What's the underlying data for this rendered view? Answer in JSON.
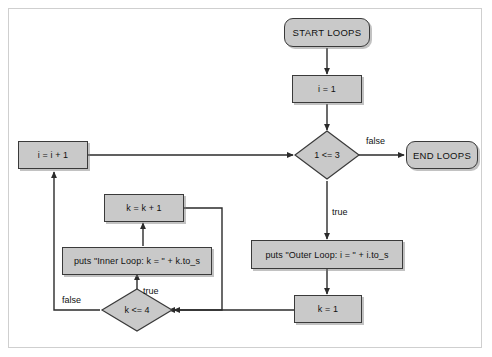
{
  "diagram": {
    "style": {
      "node_fill": "#c9c9c9",
      "node_stroke": "#3a3a3a",
      "line_color": "#2b2b2b",
      "frame_color": "#cfcfcf",
      "background": "#ffffff"
    },
    "nodes": [
      {
        "id": "start",
        "type": "terminator",
        "label": "START LOOPS"
      },
      {
        "id": "i_init",
        "type": "process",
        "label": "i = 1"
      },
      {
        "id": "i_cond",
        "type": "decision",
        "label": "1 <= 3"
      },
      {
        "id": "end",
        "type": "terminator",
        "label": "END LOOPS"
      },
      {
        "id": "i_incr",
        "type": "process",
        "label": "i = i + 1"
      },
      {
        "id": "outer_puts",
        "type": "process",
        "label": "puts \"Outer Loop: i = \" + i.to_s"
      },
      {
        "id": "k_init",
        "type": "process",
        "label": "k = 1"
      },
      {
        "id": "k_cond",
        "type": "decision",
        "label": "k <= 4"
      },
      {
        "id": "inner_puts",
        "type": "process",
        "label": "puts \"Inner Loop: k = \" + k.to_s"
      },
      {
        "id": "k_incr",
        "type": "process",
        "label": "k = k + 1"
      }
    ],
    "edge_labels": {
      "i_cond_false": "false",
      "i_cond_true": "true",
      "k_cond_false": "false",
      "k_cond_true": "true"
    },
    "edges": [
      {
        "from": "start",
        "to": "i_init",
        "label": ""
      },
      {
        "from": "i_init",
        "to": "i_cond",
        "label": ""
      },
      {
        "from": "i_cond",
        "to": "end",
        "label": "false"
      },
      {
        "from": "i_cond",
        "to": "outer_puts",
        "label": "true"
      },
      {
        "from": "outer_puts",
        "to": "k_init",
        "label": ""
      },
      {
        "from": "k_init",
        "to": "k_cond",
        "label": ""
      },
      {
        "from": "k_cond",
        "to": "inner_puts",
        "label": "true"
      },
      {
        "from": "inner_puts",
        "to": "k_incr",
        "label": ""
      },
      {
        "from": "k_incr",
        "to": "k_cond",
        "label": ""
      },
      {
        "from": "k_cond",
        "to": "i_incr",
        "label": "false"
      },
      {
        "from": "i_incr",
        "to": "i_cond",
        "label": ""
      }
    ]
  }
}
